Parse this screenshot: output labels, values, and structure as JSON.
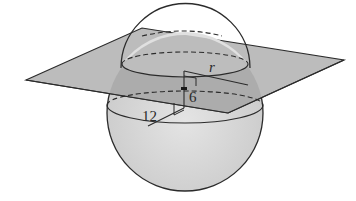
{
  "diagram": {
    "type": "geometry",
    "labels": {
      "radius_of_section": "r",
      "distance_center_to_plane": "6",
      "sphere_radius": "12"
    },
    "colors": {
      "plane_fill": "#b9b9b9",
      "plane_fill_inside": "#9d9d9d",
      "sphere_fill": "#d4d4d4",
      "sphere_cap_fill": "#dedede",
      "stroke": "#2b2b2b",
      "background": "#ffffff"
    }
  }
}
